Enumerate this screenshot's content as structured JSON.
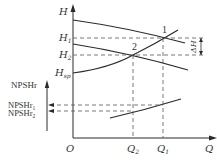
{
  "diagram": {
    "type": "pump-curve-characteristic",
    "axes": {
      "h_axis_label": "H",
      "q_axis_label": "Q",
      "origin_label": "O",
      "npshr_axis_label": "NPSHr"
    },
    "h_levels": {
      "h1": {
        "name": "H",
        "sub": "1"
      },
      "h2": {
        "name": "H",
        "sub": "2"
      },
      "hsp": {
        "name": "H",
        "sub": "sp"
      }
    },
    "q_levels": {
      "q2": {
        "name": "Q",
        "sub": "2"
      },
      "q1": {
        "name": "Q",
        "sub": "1"
      }
    },
    "npshr_levels": {
      "npshr1": {
        "name": "NPSHr",
        "sub": "1"
      },
      "npshr2": {
        "name": "NPSHr",
        "sub": "2"
      }
    },
    "points": {
      "p1": "1",
      "p2": "2"
    },
    "delta_label": "ΔH",
    "curves": [
      "pump H-Q curve (upper)",
      "pump H-Q curve (lower)",
      "system curve starting at H_sp",
      "NPSHr-Q curve"
    ],
    "colors": {
      "line": "#2a2a2a",
      "dash": "#555555",
      "text": "#333333"
    }
  }
}
